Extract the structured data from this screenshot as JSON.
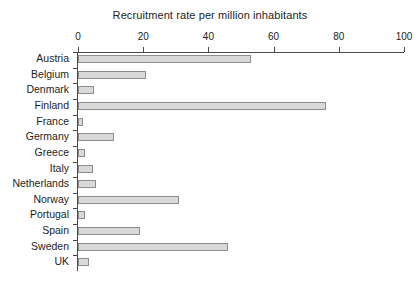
{
  "chart_data": {
    "type": "bar",
    "orientation": "horizontal",
    "title": "Recruitment rate per million inhabitants",
    "xlabel": "",
    "ylabel": "",
    "xlim": [
      0,
      100
    ],
    "xticks": [
      0,
      20,
      40,
      60,
      80,
      100
    ],
    "xtick_labels": [
      "0",
      "20",
      "40",
      "60",
      "80",
      "100"
    ],
    "grid": false,
    "legend": false,
    "bar_fill_color": "#d9d9d9",
    "bar_edge_color": "#8c8c8c",
    "axis_color": "#4a4a4a",
    "background_color": "#ffffff",
    "categories": [
      "Austria",
      "Belgium",
      "Denmark",
      "Finland",
      "France",
      "Germany",
      "Greece",
      "Italy",
      "Netherlands",
      "Norway",
      "Portugal",
      "Spain",
      "Sweden",
      "UK"
    ],
    "values": [
      53,
      21,
      5,
      76,
      1.5,
      11,
      2,
      4.5,
      5.5,
      31,
      2,
      19,
      46,
      3.5
    ]
  }
}
